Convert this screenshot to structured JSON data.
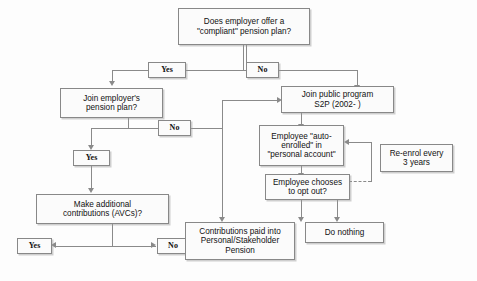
{
  "diagram": {
    "title_box": {
      "line1": "Does employer offer  a",
      "line2": "\"compliant\" pension plan?"
    },
    "nodes": {
      "employer_plan": {
        "line1": "Join employer's",
        "line2": "pension plan?"
      },
      "public_program": {
        "line1": "Join public program",
        "line2": "S2P (2002- )"
      },
      "auto_enrolled": {
        "line1": "Employee \"auto-",
        "line2": "enrolled\" in",
        "line3": "\"personal account\""
      },
      "re_enrol": {
        "line1": "Re-enrol every",
        "line2": "3 years"
      },
      "opt_out": {
        "line1": "Employee chooses",
        "line2": "to opt out?"
      },
      "avc": {
        "line1": "Make additional",
        "line2": "contributions (AVCs)?"
      },
      "contributions": {
        "line1": "Contributions paid into",
        "line2": "Personal/Stakeholder",
        "line3": "Pension"
      },
      "do_nothing": {
        "line1": "Do nothing"
      }
    },
    "labels": {
      "top_yes": "Yes",
      "top_no": "No",
      "employer_no": "No",
      "employer_yes": "Yes",
      "avc_yes": "Yes",
      "avc_no": "No"
    },
    "colors": {
      "line": "#8a8a8a",
      "box_border": "#888888",
      "box_fill": "#fbfbfb",
      "background": "#fdfdfd",
      "text": "#111111"
    }
  }
}
